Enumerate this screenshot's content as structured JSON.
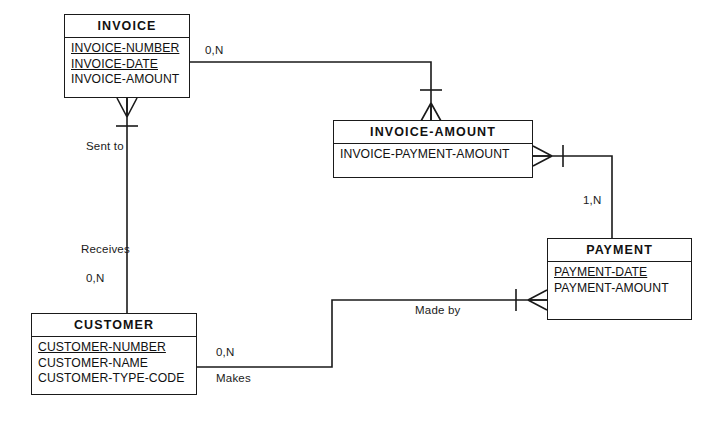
{
  "diagram": {
    "type": "entity-relationship-diagram",
    "notation": "crows-foot",
    "background": "#ffffff",
    "line_color": "#1a1a1a",
    "entities": [
      {
        "id": "invoice",
        "name": "INVOICE",
        "attributes": [
          {
            "label": "INVOICE-NUMBER",
            "key": true
          },
          {
            "label": "INVOICE-DATE",
            "key": true
          },
          {
            "label": "INVOICE-AMOUNT",
            "key": false
          }
        ]
      },
      {
        "id": "invoice_amount",
        "name": "INVOICE-AMOUNT",
        "attributes": [
          {
            "label": "INVOICE-PAYMENT-AMOUNT",
            "key": false
          }
        ]
      },
      {
        "id": "payment",
        "name": "PAYMENT",
        "attributes": [
          {
            "label": "PAYMENT-DATE",
            "key": true
          },
          {
            "label": "PAYMENT-AMOUNT",
            "key": false
          }
        ]
      },
      {
        "id": "customer",
        "name": "CUSTOMER",
        "attributes": [
          {
            "label": "CUSTOMER-NUMBER",
            "key": true
          },
          {
            "label": "CUSTOMER-NAME",
            "key": false
          },
          {
            "label": "CUSTOMER-TYPE-CODE",
            "key": false
          }
        ]
      }
    ],
    "relationships": [
      {
        "id": "invoice_to_invoice_amount",
        "from": "invoice",
        "to": "invoice_amount",
        "cardinality": "0,N",
        "verb": ""
      },
      {
        "id": "invoice_amount_to_payment",
        "from": "invoice_amount",
        "to": "payment",
        "cardinality": "1,N",
        "verb": ""
      },
      {
        "id": "invoice_to_customer",
        "from": "invoice",
        "to": "customer",
        "cardinality": "0,N",
        "verb_top": "Sent to",
        "verb_bottom": "Receives"
      },
      {
        "id": "customer_to_payment",
        "from": "customer",
        "to": "payment",
        "cardinality": "0,N",
        "verb_near_customer": "Makes",
        "verb_near_payment": "Made by"
      }
    ],
    "labels": {
      "card_invoice_top": "0,N",
      "card_invoice_amount_payment": "1,N",
      "card_invoice_customer": "0,N",
      "card_customer_makes": "0,N",
      "verb_sent_to": "Sent to",
      "verb_receives": "Receives",
      "verb_makes": "Makes",
      "verb_made_by": "Made by"
    }
  }
}
